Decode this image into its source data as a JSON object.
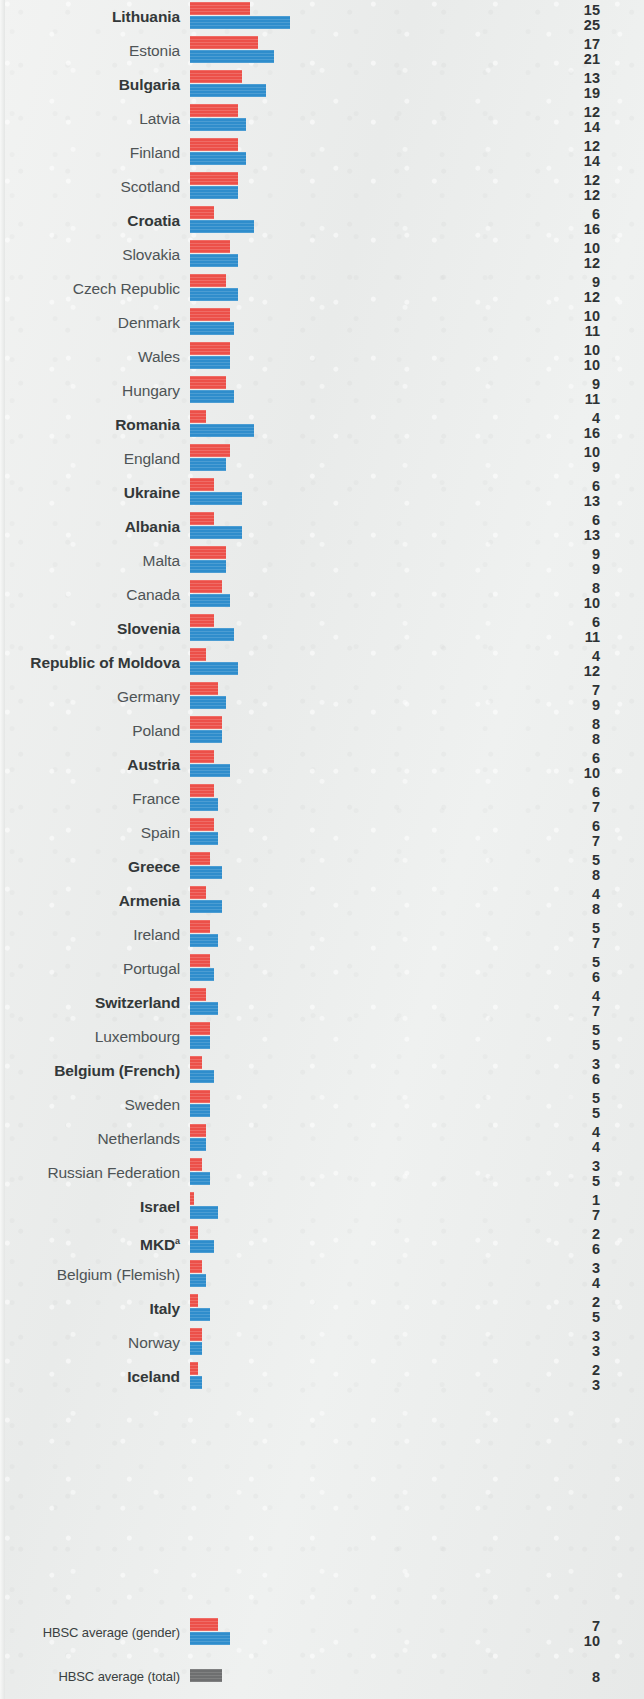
{
  "chart_data": {
    "type": "bar",
    "orientation": "horizontal",
    "title": "",
    "subtitle": "",
    "xlabel": "",
    "ylabel": "",
    "xlim": [
      0,
      26
    ],
    "grid": false,
    "legend_position": "none",
    "value_labels": true,
    "unit": "%",
    "categories": [
      "Lithuania",
      "Estonia",
      "Bulgaria",
      "Latvia",
      "Finland",
      "Scotland",
      "Croatia",
      "Slovakia",
      "Czech Republic",
      "Denmark",
      "Wales",
      "Hungary",
      "Romania",
      "England",
      "Ukraine",
      "Albania",
      "Malta",
      "Canada",
      "Slovenia",
      "Republic of Moldova",
      "Germany",
      "Poland",
      "Austria",
      "France",
      "Spain",
      "Greece",
      "Armenia",
      "Ireland",
      "Portugal",
      "Switzerland",
      "Luxembourg",
      "Belgium (French)",
      "Sweden",
      "Netherlands",
      "Russian Federation",
      "Israel",
      "MKD",
      "Belgium (Flemish)",
      "Italy",
      "Norway",
      "Iceland"
    ],
    "series": [
      {
        "name": "boys",
        "color": "#ec5049",
        "values": [
          15,
          17,
          13,
          12,
          12,
          12,
          6,
          10,
          9,
          10,
          10,
          9,
          4,
          10,
          6,
          6,
          9,
          8,
          6,
          4,
          7,
          8,
          6,
          6,
          6,
          5,
          4,
          5,
          5,
          4,
          5,
          3,
          5,
          4,
          3,
          1,
          2,
          3,
          2,
          3,
          2
        ]
      },
      {
        "name": "girls",
        "color": "#2f8dcc",
        "values": [
          25,
          21,
          19,
          14,
          14,
          12,
          16,
          12,
          12,
          11,
          10,
          11,
          16,
          9,
          13,
          13,
          9,
          10,
          11,
          12,
          9,
          8,
          10,
          7,
          7,
          8,
          8,
          7,
          6,
          7,
          5,
          6,
          5,
          4,
          5,
          7,
          6,
          4,
          5,
          3,
          3
        ]
      }
    ],
    "averages": [
      {
        "label": "HBSC average (gender)",
        "boys": 7,
        "girls": 10,
        "bold": false
      },
      {
        "label": "HBSC average (total)",
        "total": 8,
        "color": "#6e6f70",
        "bold": false
      }
    ],
    "bold_categories": [
      "Lithuania",
      "Bulgaria",
      "Croatia",
      "Romania",
      "Ukraine",
      "Albania",
      "Slovenia",
      "Republic of Moldova",
      "Austria",
      "Greece",
      "Armenia",
      "Switzerland",
      "Belgium (French)",
      "Israel",
      "MKD",
      "Italy",
      "Iceland"
    ],
    "footnote_markers": {
      "MKD": "a"
    }
  },
  "layout": {
    "row_pitch_px": 34,
    "baseline_x_px": 190,
    "px_per_unit": 4,
    "first_row_top_px": 0,
    "avg_gender_row_top_px": 1616,
    "avg_total_row_top_px": 1660
  }
}
